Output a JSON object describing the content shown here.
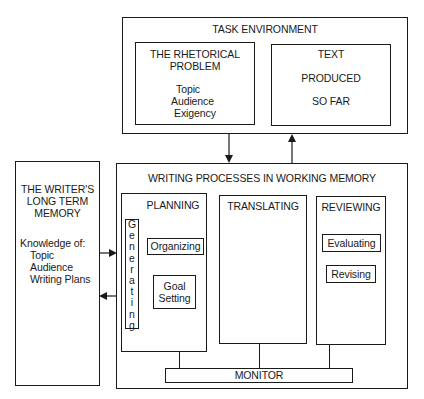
{
  "task_environment": {
    "title": "TASK ENVIRONMENT",
    "rhetorical_problem": {
      "title_lines": [
        "THE RHETORICAL",
        "PROBLEM"
      ],
      "items": [
        "Topic",
        "Audience",
        "Exigency"
      ]
    },
    "text_produced": {
      "lines": [
        "TEXT",
        "PRODUCED",
        "SO FAR"
      ]
    }
  },
  "long_term_memory": {
    "title_lines": [
      "THE WRITER'S",
      "LONG TERM",
      "MEMORY"
    ],
    "knowledge_label": "Knowledge of:",
    "items": [
      "Topic",
      "Audience",
      "Writing Plans"
    ]
  },
  "writing_processes": {
    "title": "WRITING PROCESSES IN WORKING MEMORY",
    "planning": {
      "title": "PLANNING",
      "generating_letters": [
        "G",
        "e",
        "n",
        "e",
        "r",
        "a",
        "t",
        "i",
        "n",
        "g"
      ],
      "organizing": "Organizing",
      "goal_setting_lines": [
        "Goal",
        "Setting"
      ]
    },
    "translating": {
      "title": "TRANSLATING"
    },
    "reviewing": {
      "title": "REVIEWING",
      "evaluating": "Evaluating",
      "revising": "Revising"
    },
    "monitor": "MONITOR"
  }
}
